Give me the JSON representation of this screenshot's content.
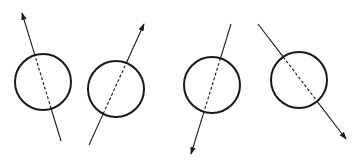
{
  "diagram": {
    "stroke_color": "#1a1a1a",
    "background": "#ffffff",
    "figures": [
      {
        "id": 1,
        "circle": {
          "cx": 43,
          "cy": 82,
          "r": 28
        },
        "line": {
          "x1": 61,
          "y1": 141,
          "x2": 22,
          "y2": 13
        },
        "arrow_end": "top",
        "dashed": {
          "x1": 35,
          "y1": 55,
          "x2": 51,
          "y2": 107
        }
      },
      {
        "id": 2,
        "circle": {
          "cx": 116,
          "cy": 89,
          "r": 28
        },
        "line": {
          "x1": 89,
          "y1": 145,
          "x2": 144,
          "y2": 24
        },
        "arrow_end": "top",
        "dashed": {
          "x1": 126,
          "y1": 63,
          "x2": 106,
          "y2": 113
        }
      },
      {
        "id": 3,
        "circle": {
          "cx": 212,
          "cy": 85,
          "r": 28
        },
        "line": {
          "x1": 231,
          "y1": 24,
          "x2": 191,
          "y2": 154
        },
        "arrow_end": "bottom",
        "dashed": {
          "x1": 219,
          "y1": 58,
          "x2": 204,
          "y2": 111
        }
      },
      {
        "id": 4,
        "circle": {
          "cx": 299,
          "cy": 80,
          "r": 28
        },
        "line": {
          "x1": 258,
          "y1": 24,
          "x2": 346,
          "y2": 139
        },
        "arrow_end": "bottom",
        "dashed": {
          "x1": 283,
          "y1": 57,
          "x2": 316,
          "y2": 100
        }
      }
    ]
  }
}
